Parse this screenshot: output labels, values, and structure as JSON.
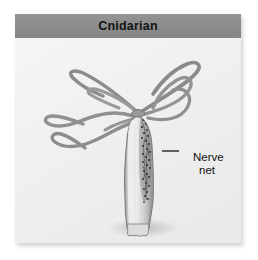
{
  "figure": {
    "header": {
      "title": "Cnidarian",
      "background_color": "#8c8c8c",
      "text_color": "#131313"
    },
    "panel": {
      "background_color": "#f2f2f2",
      "border_color": "#dcdcdc"
    },
    "labels": [
      {
        "name": "nerve-net",
        "line_1": "Nerve",
        "line_2": "net",
        "leader_line": true,
        "color": "#111111"
      }
    ],
    "illustration": {
      "subject": "hydra",
      "description": "Cnidarian polyp with tentacles and body column",
      "parts": [
        "tentacle",
        "hypostome",
        "body-column",
        "nerve-net-region",
        "pedal-disc"
      ],
      "tentacle_count": 6,
      "body_color": "#cfcfcf",
      "outline_color": "#6e6e6e",
      "nerve_net_color": "#3c3c3c",
      "shadow_color": "#c9c9c9"
    }
  }
}
